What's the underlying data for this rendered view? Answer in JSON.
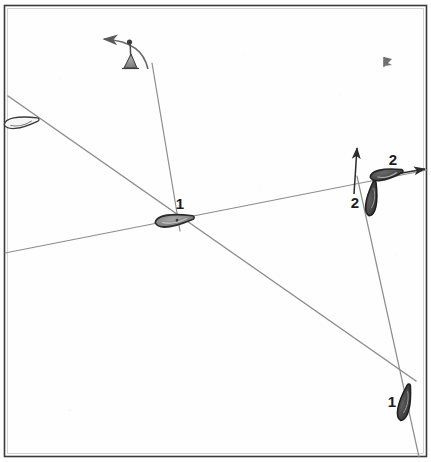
{
  "diagram": {
    "canvas": {
      "width": 431,
      "height": 462,
      "background": "#fefefe"
    },
    "frame": {
      "name": "diagram-border",
      "stroke": "#3a3a3a",
      "inner_stroke": "#9a9a9a",
      "x": 4,
      "y": 5,
      "width": 423,
      "height": 452
    },
    "colors": {
      "line": "#8d8d8d",
      "arrow": "#2b2b2b",
      "hull_dark": "#4a4a4a",
      "hull_mid": "#808080",
      "hull_light": "#f2f2f2",
      "outline": "#2b2b2b",
      "label": "#1c1c1c"
    },
    "tracks": [
      {
        "name": "track-diagonal",
        "label": "port-tack diagonal track",
        "from": {
          "x": 8,
          "y": 96
        },
        "to": {
          "x": 416,
          "y": 381
        },
        "stroke": "#8d8d8d",
        "width": 1.4
      },
      {
        "name": "track-shallow",
        "label": "shallow rising track to the mark",
        "from": {
          "x": 5,
          "y": 253
        },
        "to": {
          "x": 427,
          "y": 170
        },
        "stroke": "#8d8d8d",
        "width": 1.2
      },
      {
        "name": "track-wind-to-boat1",
        "label": "track from wind indicator down to boat 1",
        "from": {
          "x": 152,
          "y": 63
        },
        "to": {
          "x": 180,
          "y": 231
        },
        "stroke": "#8d8d8d",
        "width": 1.2
      },
      {
        "name": "track-right-vertical",
        "label": "near-vertical track on the right side",
        "from": {
          "x": 357,
          "y": 176
        },
        "to": {
          "x": 419,
          "y": 457
        },
        "stroke": "#8d8d8d",
        "width": 1.2
      }
    ],
    "arrows": [
      {
        "name": "arrow-up-boat2",
        "label": "heading arrow pointing up",
        "from": {
          "x": 355,
          "y": 190
        },
        "to": {
          "x": 357,
          "y": 146
        }
      },
      {
        "name": "arrow-right-boat2",
        "label": "heading arrow pointing right",
        "from": {
          "x": 392,
          "y": 174
        },
        "to": {
          "x": 427,
          "y": 169
        }
      },
      {
        "name": "arrow-wind",
        "label": "curved wind direction arrow pointing left",
        "to": {
          "x": 101,
          "y": 39
        }
      }
    ],
    "boats": [
      {
        "name": "boat-1-at-mark",
        "label": "1",
        "label_x": 184,
        "label_y": 208,
        "cx": 175,
        "cy": 220,
        "rotation": -8,
        "length": 42,
        "beam": 14,
        "fill": "#8a8a8a",
        "description": "boat 1 at the crossing point, bow to the right"
      },
      {
        "name": "boat-2-horizontal",
        "label": "2",
        "label_x": 392,
        "label_y": 165,
        "cx": 388,
        "cy": 174,
        "rotation": -10,
        "length": 34,
        "beam": 13,
        "fill": "#6e6e6e",
        "description": "boat 2 above the mark, bow to the right"
      },
      {
        "name": "boat-2-vertical",
        "label": "2",
        "label_x": 354,
        "label_y": 206,
        "cx": 372,
        "cy": 198,
        "rotation": -82,
        "length": 36,
        "beam": 13,
        "fill": "#4f4f4f",
        "description": "boat 2 below the mark, bow up"
      },
      {
        "name": "boat-1-lower-right",
        "label": "1",
        "label_x": 391,
        "label_y": 406,
        "cx": 405,
        "cy": 402,
        "rotation": -78,
        "length": 38,
        "beam": 14,
        "fill": "#454545",
        "description": "boat 1 approaching from lower right, bow up"
      },
      {
        "name": "boat-outline-upper-left",
        "label": "",
        "cx": 22,
        "cy": 122,
        "rotation": -8,
        "length": 36,
        "beam": 13,
        "fill": "#f4f4f4",
        "description": "unshaded boat outline at upper left on the diagonal"
      }
    ],
    "marks": [
      {
        "name": "wind-indicator",
        "label": "wind direction indicator with curved arrow",
        "x": 130,
        "y": 55
      },
      {
        "name": "small-flag-mark",
        "label": "small dark flag mark",
        "x": 385,
        "y": 61
      }
    ],
    "labels": [
      {
        "name": "boat-label-1-center",
        "text": "1"
      },
      {
        "name": "boat-label-2-upper",
        "text": "2"
      },
      {
        "name": "boat-label-2-lower",
        "text": "2"
      },
      {
        "name": "boat-label-1-lower",
        "text": "1"
      }
    ]
  }
}
